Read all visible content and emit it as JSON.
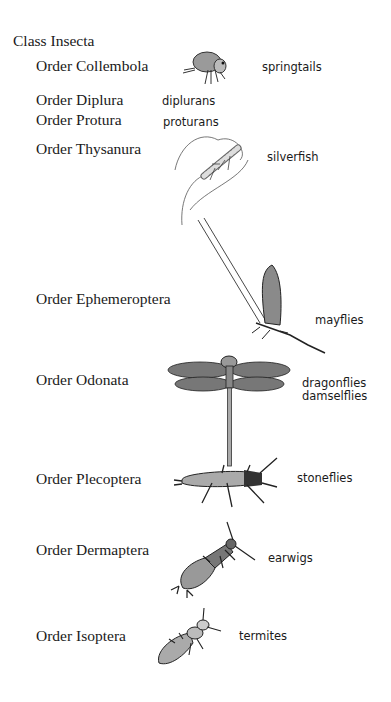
{
  "title": "Class Insecta",
  "orders": [
    {
      "name": "Order Collembola",
      "common": "springtails",
      "illustration": "springtail-icon"
    },
    {
      "name": "Order Diplura",
      "common": "diplurans"
    },
    {
      "name": "Order Protura",
      "common": "proturans"
    },
    {
      "name": "Order Thysanura",
      "common": "silverfish",
      "illustration": "silverfish-icon"
    },
    {
      "name": "Order Ephemeroptera",
      "common": "mayflies",
      "illustration": "mayfly-icon"
    },
    {
      "name": "Order Odonata",
      "common": [
        "dragonflies",
        "damselflies"
      ],
      "illustration": "dragonfly-icon"
    },
    {
      "name": "Order Plecoptera",
      "common": "stoneflies",
      "illustration": "stonefly-icon"
    },
    {
      "name": "Order Dermaptera",
      "common": "earwigs",
      "illustration": "earwig-icon"
    },
    {
      "name": "Order Isoptera",
      "common": "termites",
      "illustration": "termite-icon"
    }
  ]
}
